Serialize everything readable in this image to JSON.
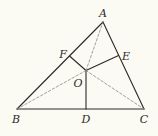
{
  "diagram": {
    "title": "",
    "points": {
      "A": {
        "label": "A",
        "x": 103,
        "y": 22
      },
      "B": {
        "label": "B",
        "x": 17,
        "y": 109
      },
      "C": {
        "label": "C",
        "x": 144,
        "y": 109
      },
      "D": {
        "label": "D",
        "x": 86,
        "y": 109
      },
      "E": {
        "label": "E",
        "x": 118.5,
        "y": 55.5
      },
      "F": {
        "label": "F",
        "x": 69.5,
        "y": 56
      },
      "O": {
        "label": "O",
        "x": 86,
        "y": 70.5
      }
    },
    "label_positions": {
      "A": {
        "x": 103,
        "y": 13
      },
      "B": {
        "x": 16,
        "y": 119
      },
      "C": {
        "x": 144,
        "y": 119
      },
      "D": {
        "x": 86,
        "y": 119
      },
      "E": {
        "x": 126,
        "y": 56
      },
      "F": {
        "x": 63,
        "y": 54
      },
      "O": {
        "x": 78,
        "y": 83
      }
    },
    "solid_segments": [
      [
        "A",
        "B"
      ],
      [
        "B",
        "C"
      ],
      [
        "C",
        "A"
      ],
      [
        "O",
        "D"
      ],
      [
        "O",
        "E"
      ],
      [
        "O",
        "F"
      ]
    ],
    "dashed_segments": [
      [
        "O",
        "A"
      ],
      [
        "O",
        "B"
      ],
      [
        "O",
        "C"
      ]
    ],
    "colors": {
      "background": "#fbfaf3",
      "solid_line": "#2a2a2a",
      "dashed_line": "#8a8a8a",
      "label": "#2a2a2a"
    }
  }
}
